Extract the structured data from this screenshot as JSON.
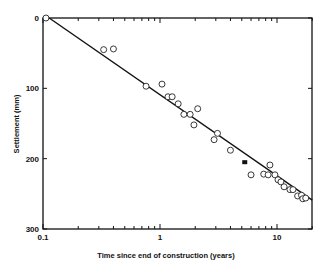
{
  "chart_data": {
    "type": "scatter",
    "title": "",
    "xlabel": "Time since end of construction (years)",
    "ylabel": "Settlement (mm)",
    "xscale": "log",
    "xlim": [
      0.1,
      20
    ],
    "ylim": [
      0,
      300
    ],
    "y_inverted": true,
    "grid": false,
    "legend": null,
    "x_tick_labels": [
      "0.1",
      "1",
      "10"
    ],
    "y_tick_labels": [
      "0",
      "100",
      "200",
      "300"
    ],
    "series": [
      {
        "name": "Measured settlement",
        "marker": "open-circle",
        "points": [
          {
            "x": 0.106,
            "y": 0
          },
          {
            "x": 0.33,
            "y": 45
          },
          {
            "x": 0.4,
            "y": 44
          },
          {
            "x": 0.76,
            "y": 97
          },
          {
            "x": 1.04,
            "y": 94
          },
          {
            "x": 1.17,
            "y": 112
          },
          {
            "x": 1.27,
            "y": 112
          },
          {
            "x": 1.43,
            "y": 122
          },
          {
            "x": 1.6,
            "y": 137
          },
          {
            "x": 1.81,
            "y": 137
          },
          {
            "x": 2.1,
            "y": 129
          },
          {
            "x": 1.95,
            "y": 152
          },
          {
            "x": 3.1,
            "y": 164
          },
          {
            "x": 2.9,
            "y": 173
          },
          {
            "x": 4.0,
            "y": 188
          },
          {
            "x": 6.0,
            "y": 223
          },
          {
            "x": 7.7,
            "y": 222
          },
          {
            "x": 8.7,
            "y": 209
          },
          {
            "x": 8.4,
            "y": 223
          },
          {
            "x": 9.6,
            "y": 223
          },
          {
            "x": 10.2,
            "y": 230
          },
          {
            "x": 10.8,
            "y": 233
          },
          {
            "x": 11.5,
            "y": 240
          },
          {
            "x": 12.9,
            "y": 244
          },
          {
            "x": 13.7,
            "y": 244
          },
          {
            "x": 15.0,
            "y": 253
          },
          {
            "x": 16.2,
            "y": 252
          },
          {
            "x": 16.6,
            "y": 257
          },
          {
            "x": 17.6,
            "y": 256
          }
        ]
      },
      {
        "name": "Single filled point",
        "marker": "filled-square",
        "points": [
          {
            "x": 5.3,
            "y": 205
          }
        ]
      },
      {
        "name": "Fitted trend line",
        "type": "line",
        "points": [
          {
            "x": 0.113,
            "y": 0
          },
          {
            "x": 20,
            "y": 259
          }
        ]
      }
    ]
  }
}
